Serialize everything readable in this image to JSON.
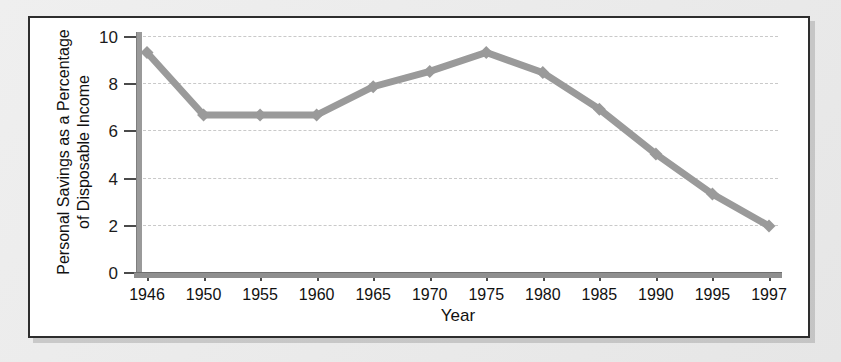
{
  "chart_data": {
    "type": "line",
    "title": "",
    "xlabel": "Year",
    "ylabel_line1": "Personal Savings as a Percentage",
    "ylabel_line2": "of Disposable Income",
    "categories": [
      "1946",
      "1950",
      "1955",
      "1960",
      "1965",
      "1970",
      "1975",
      "1980",
      "1985",
      "1990",
      "1995",
      "1997"
    ],
    "values": [
      9.3,
      6.65,
      6.65,
      6.65,
      7.85,
      8.5,
      9.3,
      8.45,
      6.9,
      5.0,
      3.3,
      1.95
    ],
    "x": [
      1946,
      1950,
      1955,
      1960,
      1965,
      1970,
      1975,
      1980,
      1985,
      1990,
      1995,
      1997
    ],
    "ylim": [
      0,
      10
    ],
    "y_ticks": [
      "0",
      "2",
      "4",
      "6",
      "8",
      "10"
    ],
    "y_tick_values": [
      0,
      2,
      4,
      6,
      8,
      10
    ],
    "grid": "horizontal-dashed",
    "legend": "none",
    "series_color": "#9a9a9a",
    "marker": "diamond",
    "axis_color": "#8f8f8f",
    "gridline_color": "#c9c9c9",
    "panel_background": "#ffffff",
    "panel_border_color": "#2e2e2e",
    "page_background": "#e9e9e9"
  }
}
